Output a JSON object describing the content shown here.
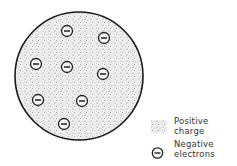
{
  "diagram": {
    "title": "",
    "atom": {
      "center": [
        79,
        76
      ],
      "radius": 64,
      "fill_color": "#d8d8d8",
      "outline_color": "#1a1a1a"
    },
    "electrons": [
      {
        "x": 67,
        "y": 31,
        "label": "−"
      },
      {
        "x": 104,
        "y": 38,
        "label": "−"
      },
      {
        "x": 36,
        "y": 64,
        "label": "−"
      },
      {
        "x": 67,
        "y": 67,
        "label": "−"
      },
      {
        "x": 103,
        "y": 74,
        "label": "−"
      },
      {
        "x": 38,
        "y": 100,
        "label": "−"
      },
      {
        "x": 82,
        "y": 101,
        "label": "−"
      },
      {
        "x": 64,
        "y": 124,
        "label": "−"
      }
    ],
    "legend": {
      "positive": {
        "line1": "Positive",
        "line2": "charge",
        "icon": "stipple-swatch-icon"
      },
      "negative": {
        "line1": "Negative",
        "line2": "electrons",
        "icon": "electron-minus-icon"
      }
    }
  }
}
